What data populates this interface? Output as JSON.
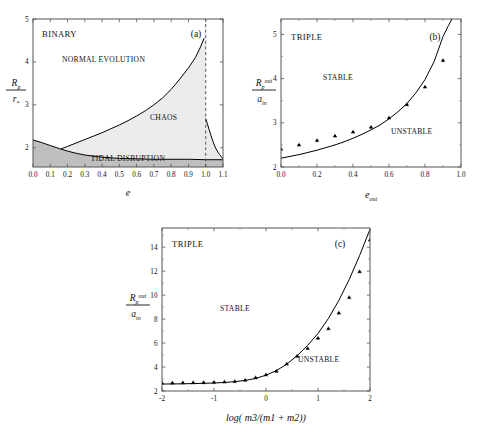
{
  "header": {
    "page_mark": ""
  },
  "figure": {
    "panels": [
      {
        "id": "a",
        "tag": "(a)",
        "system_label": "BINARY",
        "regions": [
          {
            "name": "normal-evolution",
            "label": "NORMAL EVOLUTION"
          },
          {
            "name": "chaos",
            "label": "CHAOS"
          },
          {
            "name": "tidal-disruption",
            "label": "TIDAL DISRUPTION"
          }
        ],
        "xlabel": "e",
        "ylabel_num": "R",
        "ylabel_num_sub": "p",
        "ylabel_den": "r",
        "ylabel_den_sub": "*",
        "xticks": [
          "0.0",
          "0.1",
          "0.2",
          "0.3",
          "0.4",
          "0.5",
          "0.6",
          "0.7",
          "0.8",
          "0.9",
          "1.0",
          "1.1"
        ],
        "xtickvals": [
          0.0,
          0.1,
          0.2,
          0.3,
          0.4,
          0.5,
          0.6,
          0.7,
          0.8,
          0.9,
          1.0,
          1.1
        ],
        "yticks": [
          "2",
          "3",
          "4",
          "5"
        ],
        "ytickvals": [
          2,
          3,
          4,
          5
        ],
        "xlim": [
          0.0,
          1.1
        ],
        "ylim": [
          1.55,
          5.0
        ],
        "dashed_line_x": 1.0,
        "shade_chaos_color": "#e8e8e8",
        "shade_tidal_color": "#bdbdbd"
      },
      {
        "id": "b",
        "tag": "(b)",
        "system_label": "TRIPLE",
        "regions": [
          {
            "name": "stable",
            "label": "STABLE"
          },
          {
            "name": "unstable",
            "label": "UNSTABLE"
          }
        ],
        "xlabel_base": "e",
        "xlabel_sub": "out",
        "ylabel_num": "R",
        "ylabel_num_sub": "p",
        "ylabel_num_sup": "out",
        "ylabel_den": "a",
        "ylabel_den_sub": "in",
        "xticks": [
          "0.0",
          "0.2",
          "0.4",
          "0.6",
          "0.8",
          "1.0"
        ],
        "xtickvals": [
          0.0,
          0.2,
          0.4,
          0.6,
          0.8,
          1.0
        ],
        "yticks": [
          "2",
          "3",
          "4",
          "5"
        ],
        "ytickvals": [
          2,
          3,
          4,
          5
        ],
        "xlim": [
          0.0,
          1.0
        ],
        "ylim": [
          2.0,
          5.35
        ]
      },
      {
        "id": "c",
        "tag": "(c)",
        "system_label": "TRIPLE",
        "regions": [
          {
            "name": "stable",
            "label": "STABLE"
          },
          {
            "name": "unstable",
            "label": "UNSTABLE"
          }
        ],
        "xlabel_full": "log( m3/(m1 + m2))",
        "ylabel_num": "R",
        "ylabel_num_sub": "p",
        "ylabel_num_sup": "out",
        "ylabel_den": "a",
        "ylabel_den_sub": "in",
        "xticks": [
          "-2",
          "-1",
          "0",
          "1",
          "2"
        ],
        "xtickvals": [
          -2,
          -1,
          0,
          1,
          2
        ],
        "yticks": [
          "2",
          "4",
          "6",
          "8",
          "10",
          "12",
          "14"
        ],
        "ytickvals": [
          2,
          4,
          6,
          8,
          10,
          12,
          14
        ],
        "xlim": [
          -2,
          2
        ],
        "ylim": [
          2.0,
          15.6
        ]
      }
    ]
  },
  "chart_data": [
    {
      "type": "area",
      "panel": "a",
      "title": "BINARY",
      "xlabel": "e",
      "ylabel": "R_p / r_*",
      "xlim": [
        0.0,
        1.1
      ],
      "ylim": [
        1.55,
        5.0
      ],
      "grid": false,
      "annotations": [
        "(a)",
        "BINARY",
        "NORMAL EVOLUTION",
        "CHAOS",
        "TIDAL DISRUPTION"
      ],
      "series": [
        {
          "name": "chaos-boundary-upper",
          "comment": "upper boundary of CHAOS region, rises steeply toward e=1",
          "x": [
            0.16,
            0.2,
            0.25,
            0.3,
            0.35,
            0.4,
            0.45,
            0.5,
            0.55,
            0.6,
            0.65,
            0.7,
            0.75,
            0.8,
            0.85,
            0.9,
            0.94,
            0.97,
            0.99
          ],
          "y": [
            1.97,
            2.03,
            2.11,
            2.19,
            2.27,
            2.35,
            2.44,
            2.53,
            2.63,
            2.74,
            2.86,
            3.0,
            3.16,
            3.36,
            3.6,
            3.86,
            4.1,
            4.35,
            4.55
          ]
        },
        {
          "name": "tidal-disruption-boundary",
          "comment": "lower boundary separating TIDAL DISRUPTION shading",
          "x": [
            0.0,
            0.05,
            0.1,
            0.16,
            0.2,
            0.25,
            0.3,
            0.35,
            0.4,
            0.5,
            0.6,
            0.7,
            0.8,
            0.9,
            1.0,
            1.1
          ],
          "y": [
            2.18,
            2.12,
            2.05,
            1.97,
            1.92,
            1.87,
            1.83,
            1.8,
            1.78,
            1.75,
            1.74,
            1.73,
            1.73,
            1.73,
            1.72,
            1.72
          ]
        },
        {
          "name": "chaos-right-branch",
          "comment": "descending branch right of e=1 bounding CHAOS",
          "x": [
            1.0,
            1.01,
            1.02,
            1.03,
            1.04,
            1.05,
            1.06,
            1.07,
            1.08,
            1.09,
            1.1
          ],
          "y": [
            2.68,
            2.55,
            2.42,
            2.29,
            2.17,
            2.06,
            1.97,
            1.9,
            1.84,
            1.79,
            1.74
          ]
        },
        {
          "name": "e-equals-1-dashed",
          "comment": "vertical dashed asymptote",
          "x": [
            1.0,
            1.0
          ],
          "y": [
            1.55,
            5.0
          ]
        }
      ]
    },
    {
      "type": "scatter",
      "panel": "b",
      "title": "TRIPLE",
      "xlabel": "e_out",
      "ylabel": "R_p^out / a_in",
      "xlim": [
        0.0,
        1.0
      ],
      "ylim": [
        2.0,
        5.35
      ],
      "grid": false,
      "annotations": [
        "(b)",
        "TRIPLE",
        "STABLE",
        "UNSTABLE"
      ],
      "series": [
        {
          "name": "numerical-points",
          "marker": "star-dot",
          "x": [
            0.0,
            0.1,
            0.2,
            0.3,
            0.4,
            0.5,
            0.6,
            0.7,
            0.8,
            0.9
          ],
          "y": [
            2.4,
            2.5,
            2.6,
            2.7,
            2.79,
            2.9,
            3.11,
            3.41,
            3.81,
            4.41
          ]
        },
        {
          "name": "analytic-curve",
          "marker": "line",
          "x": [
            0.0,
            0.05,
            0.1,
            0.15,
            0.2,
            0.25,
            0.3,
            0.35,
            0.4,
            0.45,
            0.5,
            0.55,
            0.6,
            0.65,
            0.7,
            0.75,
            0.8,
            0.85,
            0.9,
            0.93,
            0.95
          ],
          "y": [
            2.2,
            2.24,
            2.28,
            2.33,
            2.38,
            2.44,
            2.5,
            2.57,
            2.65,
            2.74,
            2.84,
            2.95,
            3.09,
            3.25,
            3.44,
            3.68,
            3.98,
            4.38,
            4.95,
            5.2,
            5.35
          ]
        }
      ]
    },
    {
      "type": "scatter",
      "panel": "c",
      "title": "TRIPLE",
      "xlabel": "log( m3/(m1 + m2))",
      "ylabel": "R_p^out / a_in",
      "xlim": [
        -2,
        2
      ],
      "ylim": [
        2.0,
        15.6
      ],
      "grid": false,
      "annotations": [
        "(c)",
        "TRIPLE",
        "STABLE",
        "UNSTABLE"
      ],
      "series": [
        {
          "name": "numerical-points",
          "marker": "star-dot",
          "x": [
            -2.0,
            -1.8,
            -1.6,
            -1.4,
            -1.2,
            -1.0,
            -0.8,
            -0.6,
            -0.4,
            -0.2,
            0.0,
            0.2,
            0.4,
            0.6,
            0.8,
            1.0,
            1.2,
            1.4,
            1.6,
            1.8,
            2.0
          ],
          "y": [
            2.66,
            2.67,
            2.68,
            2.69,
            2.7,
            2.72,
            2.76,
            2.8,
            2.9,
            3.1,
            3.35,
            3.65,
            4.25,
            4.9,
            5.55,
            6.4,
            7.2,
            8.5,
            9.8,
            11.95,
            14.6
          ]
        },
        {
          "name": "analytic-curve",
          "marker": "line",
          "x": [
            -2.0,
            -1.8,
            -1.6,
            -1.4,
            -1.2,
            -1.0,
            -0.8,
            -0.6,
            -0.4,
            -0.2,
            0.0,
            0.2,
            0.4,
            0.6,
            0.8,
            1.0,
            1.2,
            1.4,
            1.6,
            1.8,
            2.0
          ],
          "y": [
            2.58,
            2.59,
            2.6,
            2.62,
            2.64,
            2.67,
            2.71,
            2.78,
            2.88,
            3.05,
            3.32,
            3.7,
            4.25,
            4.95,
            5.8,
            6.8,
            8.05,
            9.55,
            11.3,
            13.3,
            15.5
          ]
        }
      ]
    }
  ]
}
